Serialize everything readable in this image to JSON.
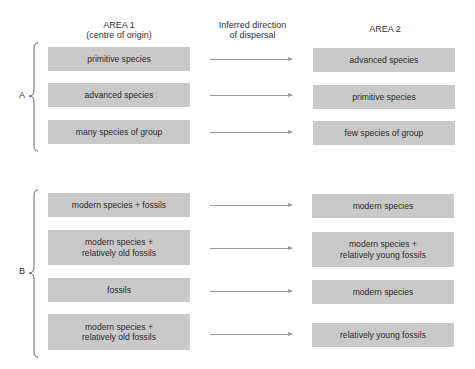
{
  "headers": {
    "area1_title": "AREA 1",
    "area1_subtitle": "(centre of origin)",
    "direction_line1": "Inferred direction",
    "direction_line2": "of dispersal",
    "area2_title": "AREA 2"
  },
  "groups": [
    {
      "label": "A",
      "rows": [
        {
          "area1": "primitive species",
          "area2": "advanced species"
        },
        {
          "area1": "advanced species",
          "area2": "primitive species"
        },
        {
          "area1": "many species of group",
          "area2": "few species of group"
        }
      ]
    },
    {
      "label": "B",
      "rows": [
        {
          "area1": "modern species + fossils",
          "area2": "modern species"
        },
        {
          "area1_line1": "modern species +",
          "area1_line2": "relatively old fossils",
          "area2_line1": "modern species +",
          "area2_line2": "relatively young fossils"
        },
        {
          "area1": "fossils",
          "area2": "modern species"
        },
        {
          "area1_line1": "modern species +",
          "area1_line2": "relatively old fossils",
          "area2": "relatively young fossils"
        }
      ]
    }
  ],
  "colors": {
    "box": "#c9c9c9",
    "arrow": "#9a9a9a",
    "text": "#2a2a2a"
  }
}
